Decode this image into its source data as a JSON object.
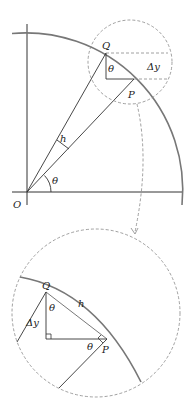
{
  "figure": {
    "colors": {
      "line": "#333333",
      "arc": "#777777",
      "dashed": "#888888",
      "background": "#ffffff"
    }
  },
  "top_diagram": {
    "labels": {
      "origin": "O",
      "point_q": "Q",
      "point_p": "P",
      "chord": "h",
      "angle_origin": "θ",
      "angle_q": "θ",
      "delta_y": "Δy"
    }
  },
  "inset_diagram": {
    "labels": {
      "point_q": "Q",
      "point_p": "P",
      "chord": "h",
      "angle_q": "θ",
      "angle_p": "θ",
      "delta_y": "Δy"
    }
  }
}
